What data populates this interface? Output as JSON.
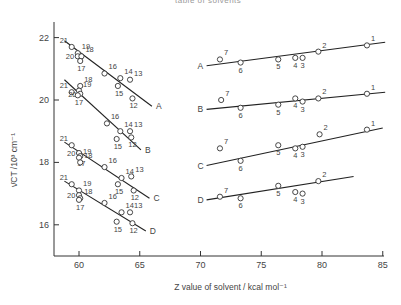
{
  "chart_data": {
    "type": "scatter",
    "title": "",
    "top_caption": "table of solvents",
    "xlabel": "Z value of solvent / kcal mol⁻¹",
    "ylabel": "ν̄CT /10³ cm⁻¹",
    "xlim": [
      58,
      85
    ],
    "ylim": [
      15,
      22.5
    ],
    "xticks": [
      60,
      65,
      70,
      75,
      80,
      85
    ],
    "yticks": [
      16,
      18,
      20,
      22
    ],
    "grid": false,
    "legend": "line labels A, B, C, D at line ends",
    "series": [
      {
        "name": "A",
        "points": [
          {
            "label": "21",
            "x": 59.4,
            "y": 21.7
          },
          {
            "label": "19",
            "x": 59.9,
            "y": 21.5
          },
          {
            "label": "20",
            "x": 59.9,
            "y": 21.4
          },
          {
            "label": "18",
            "x": 60.2,
            "y": 21.4
          },
          {
            "label": "17",
            "x": 60.1,
            "y": 21.25
          },
          {
            "label": "16",
            "x": 62.1,
            "y": 20.85
          },
          {
            "label": "14",
            "x": 63.4,
            "y": 20.7
          },
          {
            "label": "15",
            "x": 63.2,
            "y": 20.45
          },
          {
            "label": "13",
            "x": 64.2,
            "y": 20.65
          },
          {
            "label": "12",
            "x": 64.4,
            "y": 20.05
          },
          {
            "label": "7",
            "x": 71.6,
            "y": 21.3
          },
          {
            "label": "6",
            "x": 73.3,
            "y": 21.2
          },
          {
            "label": "5",
            "x": 76.4,
            "y": 21.3
          },
          {
            "label": "4",
            "x": 77.8,
            "y": 21.35
          },
          {
            "label": "3",
            "x": 78.4,
            "y": 21.35
          },
          {
            "label": "2",
            "x": 79.7,
            "y": 21.55
          },
          {
            "label": "1",
            "x": 83.7,
            "y": 21.75
          }
        ],
        "fit_lines": [
          {
            "x": [
              58.8,
              66.0
            ],
            "y": [
              21.9,
              19.8
            ]
          },
          {
            "x": [
              70.5,
              85.2
            ],
            "y": [
              21.1,
              21.85
            ]
          }
        ]
      },
      {
        "name": "B",
        "points": [
          {
            "label": "18",
            "x": 60.1,
            "y": 20.45
          },
          {
            "label": "19",
            "x": 60.0,
            "y": 20.3
          },
          {
            "label": "21",
            "x": 59.4,
            "y": 20.25
          },
          {
            "label": "20",
            "x": 60.1,
            "y": 20.2
          },
          {
            "label": "17",
            "x": 59.9,
            "y": 20.15
          },
          {
            "label": "16",
            "x": 62.3,
            "y": 19.25
          },
          {
            "label": "14",
            "x": 63.4,
            "y": 19.0
          },
          {
            "label": "15",
            "x": 63.1,
            "y": 18.75
          },
          {
            "label": "13",
            "x": 64.2,
            "y": 19.0
          },
          {
            "label": "12",
            "x": 64.3,
            "y": 18.8
          },
          {
            "label": "7",
            "x": 71.7,
            "y": 20.0
          },
          {
            "label": "6",
            "x": 73.3,
            "y": 19.75
          },
          {
            "label": "5",
            "x": 76.4,
            "y": 19.85
          },
          {
            "label": "4",
            "x": 77.8,
            "y": 20.05
          },
          {
            "label": "3",
            "x": 78.4,
            "y": 19.95
          },
          {
            "label": "2",
            "x": 79.7,
            "y": 20.05
          },
          {
            "label": "1",
            "x": 83.7,
            "y": 20.2
          }
        ],
        "fit_lines": [
          {
            "x": [
              58.8,
              65.1
            ],
            "y": [
              20.65,
              18.4
            ]
          },
          {
            "x": [
              70.5,
              85.2
            ],
            "y": [
              19.7,
              20.25
            ]
          }
        ]
      },
      {
        "name": "C",
        "points": [
          {
            "label": "21",
            "x": 59.4,
            "y": 18.55
          },
          {
            "label": "20",
            "x": 60.0,
            "y": 18.3
          },
          {
            "label": "17",
            "x": 60.1,
            "y": 18.2
          },
          {
            "label": "19",
            "x": 60.0,
            "y": 18.15
          },
          {
            "label": "18",
            "x": 60.1,
            "y": 18.0
          },
          {
            "label": "16",
            "x": 62.1,
            "y": 17.85
          },
          {
            "label": "14",
            "x": 63.5,
            "y": 17.5
          },
          {
            "label": "15",
            "x": 63.2,
            "y": 17.3
          },
          {
            "label": "13",
            "x": 64.3,
            "y": 17.55
          },
          {
            "label": "12",
            "x": 64.5,
            "y": 17.1
          },
          {
            "label": "7",
            "x": 71.6,
            "y": 18.45
          },
          {
            "label": "6",
            "x": 73.3,
            "y": 18.05
          },
          {
            "label": "5",
            "x": 76.4,
            "y": 18.55
          },
          {
            "label": "4",
            "x": 77.8,
            "y": 18.45
          },
          {
            "label": "3",
            "x": 78.4,
            "y": 18.5
          },
          {
            "label": "2",
            "x": 79.8,
            "y": 18.9
          },
          {
            "label": "1",
            "x": 83.7,
            "y": 19.05
          }
        ],
        "fit_lines": [
          {
            "x": [
              58.8,
              65.8
            ],
            "y": [
              18.65,
              16.85
            ]
          },
          {
            "x": [
              70.5,
              85.0
            ],
            "y": [
              17.9,
              19.1
            ]
          }
        ]
      },
      {
        "name": "D",
        "points": [
          {
            "label": "21",
            "x": 59.4,
            "y": 17.3
          },
          {
            "label": "19",
            "x": 60.0,
            "y": 17.1
          },
          {
            "label": "20",
            "x": 60.0,
            "y": 16.95
          },
          {
            "label": "18",
            "x": 60.1,
            "y": 16.85
          },
          {
            "label": "17",
            "x": 60.0,
            "y": 16.8
          },
          {
            "label": "16",
            "x": 62.1,
            "y": 16.7
          },
          {
            "label": "14",
            "x": 63.5,
            "y": 16.4
          },
          {
            "label": "15",
            "x": 63.1,
            "y": 16.1
          },
          {
            "label": "13",
            "x": 64.2,
            "y": 16.4
          },
          {
            "label": "12",
            "x": 64.4,
            "y": 16.05
          },
          {
            "label": "7",
            "x": 71.6,
            "y": 16.9
          },
          {
            "label": "6",
            "x": 73.3,
            "y": 16.85
          },
          {
            "label": "5",
            "x": 76.4,
            "y": 17.25
          },
          {
            "label": "4",
            "x": 77.8,
            "y": 17.05
          },
          {
            "label": "3",
            "x": 78.4,
            "y": 17.0
          },
          {
            "label": "2",
            "x": 79.7,
            "y": 17.4
          }
        ],
        "fit_lines": [
          {
            "x": [
              58.8,
              65.5
            ],
            "y": [
              17.4,
              15.8
            ]
          },
          {
            "x": [
              70.5,
              82.6
            ],
            "y": [
              16.8,
              17.55
            ]
          }
        ]
      }
    ]
  }
}
